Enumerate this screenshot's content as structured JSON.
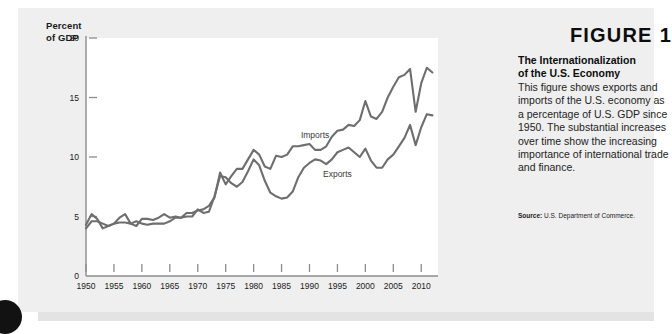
{
  "figure": {
    "heading_word": "FIGURE",
    "heading_number": "1",
    "title_line1": "The Internationalization",
    "title_line2": "of the U.S. Economy",
    "description": "This figure shows exports and imports of the U.S. economy as a percentage of U.S. GDP since 1950. The substantial increases over time show the increasing importance of international trade and finance.",
    "source_label": "Source:",
    "source_text": "U.S. Department of Commerce."
  },
  "axis": {
    "y_title_line1": "Percent",
    "y_title_line2": "of GDP"
  },
  "colors": {
    "card_background": "#efefef",
    "plot_background": "#ffffff",
    "line": "#6e6e6e",
    "axis": "#8c8c8c",
    "text": "#1b1b1b"
  },
  "chart_data": {
    "type": "line",
    "title": "The Internationalization of the U.S. Economy",
    "xlabel": "",
    "ylabel": "Percent of GDP",
    "xlim": [
      1950,
      2013
    ],
    "ylim": [
      0,
      20
    ],
    "xticks": [
      1950,
      1955,
      1960,
      1965,
      1970,
      1975,
      1980,
      1985,
      1990,
      1995,
      2000,
      2005,
      2010
    ],
    "yticks": [
      0,
      5,
      10,
      15,
      20
    ],
    "grid": false,
    "legend": "inline-annotations",
    "annotations": [
      {
        "text": "Imports",
        "x": 1991,
        "y": 11.6
      },
      {
        "text": "Exports",
        "x": 1995,
        "y": 8.3
      }
    ],
    "x": [
      1950,
      1951,
      1952,
      1953,
      1954,
      1955,
      1956,
      1957,
      1958,
      1959,
      1960,
      1961,
      1962,
      1963,
      1964,
      1965,
      1966,
      1967,
      1968,
      1969,
      1970,
      1971,
      1972,
      1973,
      1974,
      1975,
      1976,
      1977,
      1978,
      1979,
      1980,
      1981,
      1982,
      1983,
      1984,
      1985,
      1986,
      1987,
      1988,
      1989,
      1990,
      1991,
      1992,
      1993,
      1994,
      1995,
      1996,
      1997,
      1998,
      1999,
      2000,
      2001,
      2002,
      2003,
      2004,
      2005,
      2006,
      2007,
      2008,
      2009,
      2010,
      2011,
      2012
    ],
    "series": [
      {
        "name": "Exports",
        "values": [
          4.3,
          5.2,
          4.8,
          4.0,
          4.2,
          4.4,
          4.9,
          5.2,
          4.4,
          4.2,
          4.8,
          4.8,
          4.7,
          4.9,
          5.2,
          4.9,
          5.0,
          4.9,
          5.0,
          5.0,
          5.6,
          5.3,
          5.4,
          6.7,
          8.4,
          8.3,
          7.8,
          7.5,
          7.9,
          8.8,
          9.8,
          9.3,
          8.0,
          7.0,
          6.7,
          6.5,
          6.6,
          7.1,
          8.3,
          9.1,
          9.5,
          9.8,
          9.7,
          9.4,
          9.8,
          10.4,
          10.6,
          10.8,
          10.4,
          10.0,
          10.7,
          9.7,
          9.1,
          9.1,
          9.8,
          10.2,
          10.9,
          11.6,
          12.7,
          11.0,
          12.5,
          13.6,
          13.5
        ]
      },
      {
        "name": "Imports",
        "values": [
          4.0,
          4.6,
          4.6,
          4.4,
          4.2,
          4.4,
          4.5,
          4.5,
          4.4,
          4.6,
          4.4,
          4.3,
          4.4,
          4.4,
          4.4,
          4.6,
          4.9,
          4.9,
          5.3,
          5.3,
          5.5,
          5.6,
          5.9,
          6.6,
          8.7,
          7.7,
          8.4,
          9.0,
          9.0,
          9.8,
          10.6,
          10.2,
          9.2,
          9.0,
          10.1,
          10.0,
          10.2,
          10.9,
          10.9,
          11.0,
          11.1,
          10.6,
          10.6,
          10.9,
          11.7,
          12.2,
          12.3,
          12.7,
          12.6,
          13.1,
          14.7,
          13.4,
          13.2,
          13.8,
          15.0,
          15.9,
          16.7,
          16.9,
          17.4,
          13.8,
          16.2,
          17.5,
          17.1
        ]
      }
    ]
  }
}
